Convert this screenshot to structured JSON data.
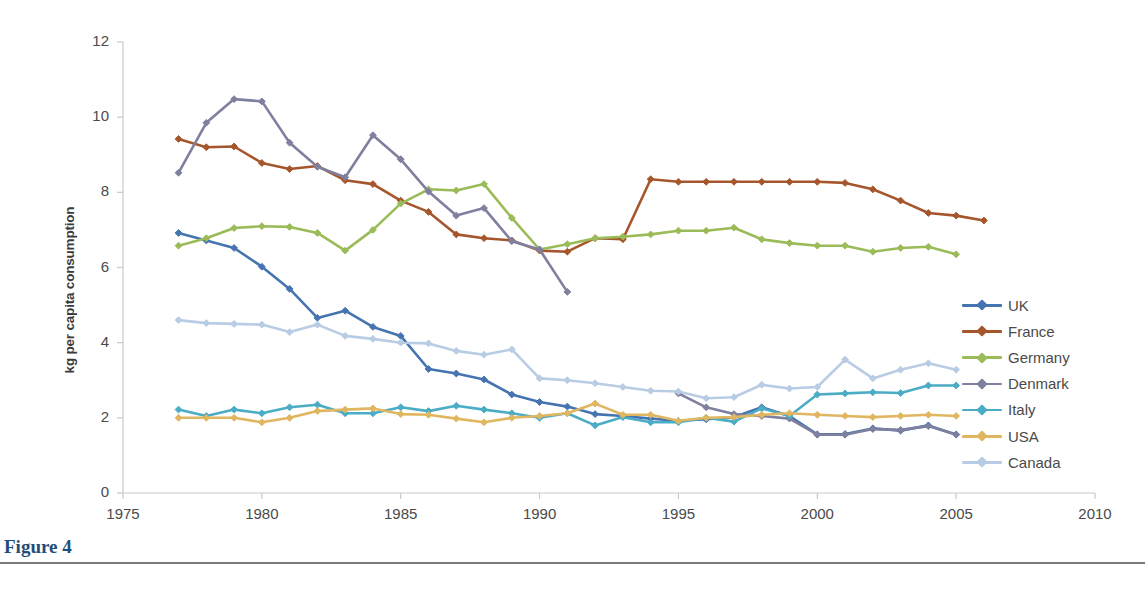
{
  "figure": {
    "caption": "Figure 4"
  },
  "chart_data": {
    "type": "line",
    "title": "",
    "xlabel": "",
    "ylabel": "kg per capita consumption",
    "xlim": [
      1975,
      2010
    ],
    "ylim": [
      0,
      12
    ],
    "xticks": [
      "1975",
      "1980",
      "1985",
      "1990",
      "1995",
      "2000",
      "2005",
      "2010"
    ],
    "yticks": [
      "0",
      "2",
      "4",
      "6",
      "8",
      "10",
      "12"
    ],
    "grid": false,
    "legend_position": "right",
    "markers": "diamond",
    "series": [
      {
        "name": "UK",
        "color": "#4674b0",
        "x": [
          1977,
          1978,
          1979,
          1980,
          1981,
          1982,
          1983,
          1984,
          1985,
          1986,
          1987,
          1988,
          1989,
          1990,
          1991,
          1992,
          1993,
          1994,
          1995,
          1996,
          1997,
          1998,
          1999,
          2000,
          2001,
          2002,
          2003,
          2004,
          2005
        ],
        "values": [
          6.92,
          6.72,
          6.52,
          6.02,
          5.43,
          4.66,
          4.85,
          4.42,
          4.18,
          3.3,
          3.18,
          3.02,
          2.62,
          2.42,
          2.3,
          2.1,
          2.05,
          1.98,
          1.92,
          1.96,
          2.02,
          2.28,
          2.05,
          1.56,
          1.57,
          1.72,
          1.66,
          1.8,
          1.56
        ]
      },
      {
        "name": "France",
        "color": "#a6562c",
        "x": [
          1977,
          1978,
          1979,
          1980,
          1981,
          1982,
          1983,
          1984,
          1985,
          1986,
          1987,
          1988,
          1989,
          1990,
          1991,
          1992,
          1993,
          1994,
          1995,
          1996,
          1997,
          1998,
          1999,
          2000,
          2001,
          2002,
          2003,
          2004,
          2005,
          2006
        ],
        "values": [
          9.42,
          9.2,
          9.22,
          8.78,
          8.62,
          8.7,
          8.32,
          8.22,
          7.78,
          7.48,
          6.88,
          6.78,
          6.72,
          6.45,
          6.42,
          6.78,
          6.75,
          8.35,
          8.28,
          8.28,
          8.28,
          8.28,
          8.28,
          8.28,
          8.25,
          8.08,
          7.78,
          7.45,
          7.38,
          7.25
        ]
      },
      {
        "name": "Germany",
        "color": "#9bbb59",
        "x": [
          1977,
          1978,
          1979,
          1980,
          1981,
          1982,
          1983,
          1984,
          1985,
          1986,
          1987,
          1988,
          1989,
          1990,
          1991,
          1992,
          1993,
          1994,
          1995,
          1996,
          1997,
          1998,
          1999,
          2000,
          2001,
          2002,
          2003,
          2004,
          2005
        ],
        "values": [
          6.58,
          6.78,
          7.05,
          7.1,
          7.08,
          6.92,
          6.45,
          7.0,
          7.7,
          8.08,
          8.05,
          8.22,
          7.32,
          6.48,
          6.62,
          6.78,
          6.82,
          6.88,
          6.98,
          6.98,
          7.06,
          6.75,
          6.65,
          6.58,
          6.58,
          6.42,
          6.52,
          6.55,
          6.35
        ]
      },
      {
        "name": "Denmark",
        "color": "#7f7f9f",
        "x": [
          1977,
          1978,
          1979,
          1980,
          1981,
          1982,
          1983,
          1984,
          1985,
          1986,
          1987,
          1988,
          1989,
          1990,
          1991
        ],
        "values": [
          8.52,
          9.85,
          10.48,
          10.42,
          9.32,
          8.68,
          8.4,
          9.52,
          8.88,
          8.02,
          7.38,
          7.58,
          6.7,
          6.48,
          5.35
        ]
      },
      {
        "name": "Denmark",
        "color": "#7f7f9f",
        "x": [
          1995,
          1996,
          1997,
          1998,
          1999,
          2000,
          2001,
          2002,
          2003,
          2004,
          2005
        ],
        "values": [
          2.65,
          2.28,
          2.1,
          2.05,
          1.98,
          1.55,
          1.55,
          1.7,
          1.68,
          1.78,
          1.55
        ]
      },
      {
        "name": "Italy",
        "color": "#4bacc6",
        "x": [
          1977,
          1978,
          1979,
          1980,
          1981,
          1982,
          1983,
          1984,
          1985,
          1986,
          1987,
          1988,
          1989,
          1990,
          1991,
          1992,
          1993,
          1994,
          1995,
          1996,
          1997,
          1998,
          1999,
          2000,
          2001,
          2002,
          2003,
          2004,
          2005
        ],
        "values": [
          2.22,
          2.05,
          2.22,
          2.12,
          2.28,
          2.35,
          2.12,
          2.12,
          2.28,
          2.18,
          2.32,
          2.22,
          2.12,
          2.0,
          2.12,
          1.8,
          2.02,
          1.88,
          1.88,
          2.0,
          1.9,
          2.25,
          2.05,
          2.62,
          2.65,
          2.68,
          2.66,
          2.86,
          2.86
        ]
      },
      {
        "name": "USA",
        "color": "#e0b760",
        "x": [
          1977,
          1978,
          1979,
          1980,
          1981,
          1982,
          1983,
          1984,
          1985,
          1986,
          1987,
          1988,
          1989,
          1990,
          1991,
          1992,
          1993,
          1994,
          1995,
          1996,
          1997,
          1998,
          1999,
          2000,
          2001,
          2002,
          2003,
          2004,
          2005
        ],
        "values": [
          2.0,
          2.0,
          2.0,
          1.88,
          2.0,
          2.18,
          2.22,
          2.25,
          2.1,
          2.08,
          1.98,
          1.88,
          2.0,
          2.05,
          2.12,
          2.38,
          2.08,
          2.08,
          1.92,
          2.0,
          2.02,
          2.08,
          2.12,
          2.08,
          2.05,
          2.02,
          2.05,
          2.08,
          2.05
        ]
      },
      {
        "name": "Canada",
        "color": "#b8cce4",
        "x": [
          1977,
          1978,
          1979,
          1980,
          1981,
          1982,
          1983,
          1984,
          1985,
          1986,
          1987,
          1988,
          1989,
          1990,
          1991,
          1992,
          1993,
          1994,
          1995,
          1996,
          1997,
          1998,
          1999,
          2000,
          2001,
          2002,
          2003,
          2004,
          2005
        ],
        "values": [
          4.6,
          4.52,
          4.5,
          4.48,
          4.28,
          4.48,
          4.18,
          4.1,
          4.0,
          3.98,
          3.78,
          3.68,
          3.82,
          3.05,
          3.0,
          2.92,
          2.82,
          2.72,
          2.7,
          2.52,
          2.55,
          2.88,
          2.78,
          2.82,
          3.55,
          3.05,
          3.28,
          3.45,
          3.28
        ]
      }
    ],
    "legend": [
      {
        "label": "UK",
        "color": "#4674b0"
      },
      {
        "label": "France",
        "color": "#a6562c"
      },
      {
        "label": "Germany",
        "color": "#9bbb59"
      },
      {
        "label": "Denmark",
        "color": "#7f7f9f"
      },
      {
        "label": "Italy",
        "color": "#4bacc6"
      },
      {
        "label": "USA",
        "color": "#e0b760"
      },
      {
        "label": "Canada",
        "color": "#b8cce4"
      }
    ]
  }
}
